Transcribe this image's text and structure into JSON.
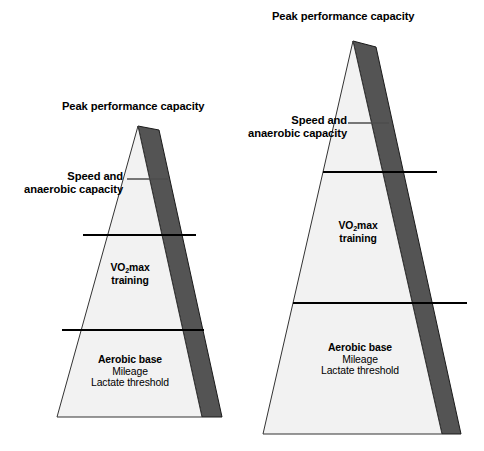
{
  "figure": {
    "title_implicit": "Training pyramid progression",
    "background_color": "#ffffff",
    "face_color": "#f2f2f2",
    "shadow_color": "#545454",
    "outline_color": "#000000"
  },
  "pyramids": [
    {
      "id": "left",
      "name": "smaller-training-pyramid",
      "apex_label": "Peak performance capacity",
      "tiers": [
        {
          "name": "speed-anaerobic-tier",
          "label_line_1": "Speed and",
          "label_line_2": "anaerobic capacity",
          "callout": true
        },
        {
          "name": "vo2max-tier",
          "label_line_1": "VO",
          "label_subscript": "2",
          "label_line_1_tail": "max",
          "label_line_2": "training",
          "callout": false
        },
        {
          "name": "aerobic-base-tier",
          "heading": "Aerobic base",
          "sub_items": [
            "Mileage",
            "Lactate threshold"
          ],
          "callout": false
        }
      ]
    },
    {
      "id": "right",
      "name": "larger-training-pyramid",
      "apex_label": "Peak performance capacity",
      "tiers": [
        {
          "name": "speed-anaerobic-tier",
          "label_line_1": "Speed and",
          "label_line_2": "anaerobic capacity",
          "callout": true
        },
        {
          "name": "vo2max-tier",
          "label_line_1": "VO",
          "label_subscript": "2",
          "label_line_1_tail": "max",
          "label_line_2": "training",
          "callout": false
        },
        {
          "name": "aerobic-base-tier",
          "heading": "Aerobic base",
          "sub_items": [
            "Mileage",
            "Lactate threshold"
          ],
          "callout": false
        }
      ]
    }
  ]
}
